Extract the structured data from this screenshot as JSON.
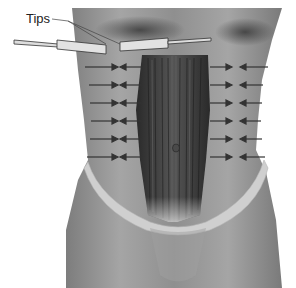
{
  "figure": {
    "type": "anatomical-illustration",
    "labels": {
      "tips": "Tips"
    },
    "arrows": {
      "left_rows": 6,
      "right_rows": 6,
      "direction": "inward toward midline"
    },
    "colors": {
      "background": "#ffffff",
      "skin": "#9a9a9a",
      "muscle": "#3a3a3a",
      "arrow": "#444444",
      "garment": "#c8c8c8"
    }
  }
}
